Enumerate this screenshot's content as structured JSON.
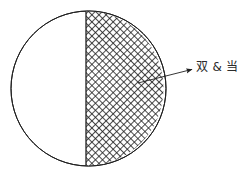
{
  "figure": {
    "title": "",
    "background_color": "#ffffff",
    "stroke_color": "#1f1f1f",
    "hatch_color": "#1f1f1f",
    "fill_color": "#ffffff",
    "shape": "circle",
    "circle": {
      "center_x": 88.5,
      "center_y": 88.5,
      "radius": 77.5,
      "stroke_width": 1
    },
    "divider": {
      "type": "vertical-chord",
      "x": 86,
      "y_top": 12,
      "y_bottom": 165,
      "stroke_width": 1.3
    },
    "regions": [
      {
        "name": "left-region",
        "fill": "plain",
        "label": ""
      },
      {
        "name": "right-region",
        "fill": "cross-hatch",
        "hatch_spacing_px": 5,
        "hatch_angle_deg": 45,
        "label": "双 & 当"
      }
    ],
    "annotation": {
      "label": "双 & 当",
      "leader": {
        "tail_x": 138,
        "tail_y": 83,
        "tip_x": 194,
        "tip_y": 69,
        "stroke_width": 1,
        "arrowhead": "solid-triangle"
      },
      "text_color": "#2b2b2b",
      "font_size_px": 12
    }
  }
}
